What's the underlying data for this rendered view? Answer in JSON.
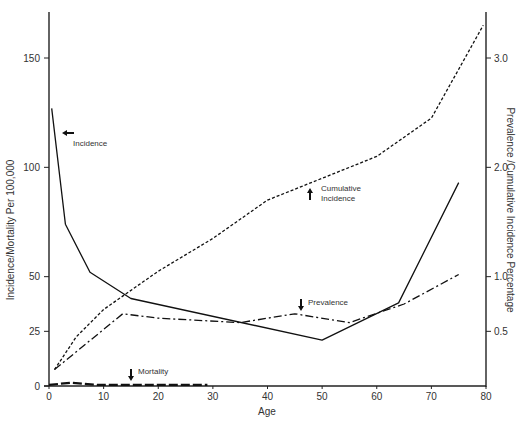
{
  "chart_data": {
    "type": "line",
    "title": "",
    "xlabel": "Age",
    "ylabel": "Incidence/Mortality Per 100,000",
    "ylabel_right": "Prevalence /Cumulative Incidence Percentage",
    "xlim": [
      0,
      80
    ],
    "ylim": [
      0,
      175
    ],
    "ylim_right": [
      0,
      3.5
    ],
    "x_ticks": [
      0,
      10,
      20,
      30,
      40,
      50,
      60,
      70,
      80
    ],
    "y_ticks": [
      0,
      25,
      50,
      100,
      150
    ],
    "y_ticks_right": [
      0.5,
      1.0,
      2.0,
      3.0
    ],
    "y_ticks_right_labels": [
      "0.5",
      "1.0",
      "2.0",
      "3.0"
    ],
    "grid": false,
    "legend": "inline annotations with arrows",
    "series": [
      {
        "name": "Incidence",
        "axis": "left",
        "style": "solid",
        "x": [
          0.5,
          3,
          7.5,
          15,
          50,
          64,
          75
        ],
        "y": [
          127,
          74,
          52,
          40,
          21,
          38,
          93
        ]
      },
      {
        "name": "Cumulative Incidence",
        "axis": "right",
        "style": "dashed",
        "x": [
          1,
          5,
          10,
          20,
          30,
          40,
          50,
          60,
          70,
          79.5
        ],
        "y": [
          0.15,
          0.45,
          0.7,
          1.05,
          1.35,
          1.7,
          1.9,
          2.1,
          2.45,
          3.3
        ]
      },
      {
        "name": "Prevalence",
        "axis": "right",
        "style": "dash-dot",
        "x": [
          1,
          13.5,
          20,
          35,
          45,
          55,
          65,
          75
        ],
        "y": [
          0.15,
          0.66,
          0.62,
          0.58,
          0.66,
          0.58,
          0.75,
          1.02
        ]
      },
      {
        "name": "Mortality",
        "axis": "left",
        "style": "long-dash",
        "x": [
          0,
          4,
          9,
          15,
          20,
          25,
          29
        ],
        "y": [
          0.5,
          1.5,
          0.5,
          0.5,
          0.5,
          0.5,
          0.5
        ]
      }
    ],
    "annotations": [
      {
        "text": "Incidence",
        "arrow": "left"
      },
      {
        "text": "Cumulative",
        "text2": "Incidence",
        "arrow": "up"
      },
      {
        "text": "Prevalence",
        "arrow": "down"
      },
      {
        "text": "Mortality",
        "arrow": "down"
      }
    ]
  }
}
